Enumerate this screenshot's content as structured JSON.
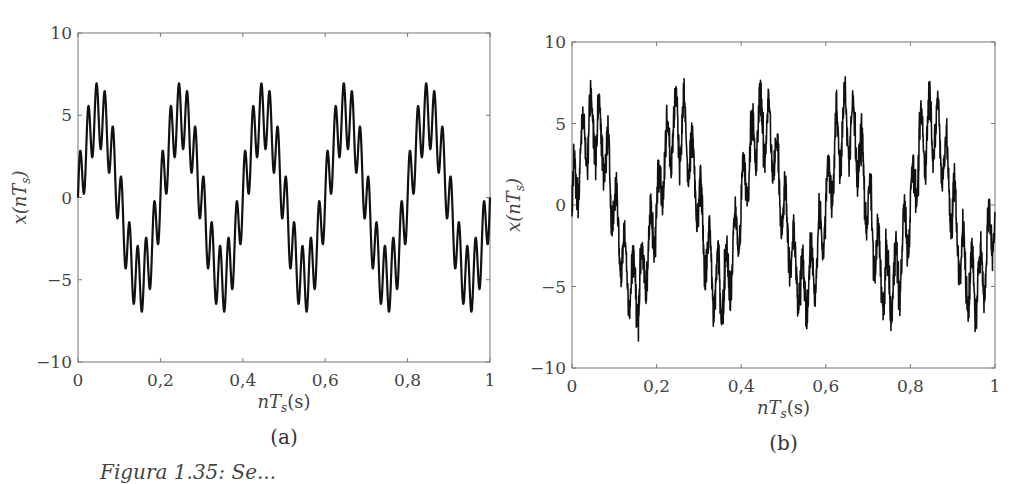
{
  "figure": {
    "caption_partial": "Figura 1.35: Se... ",
    "panels": [
      {
        "id": "a",
        "label": "(a)"
      },
      {
        "id": "b",
        "label": "(b)"
      }
    ]
  },
  "chart_data": [
    {
      "type": "line",
      "title": "(a)",
      "xlabel": "nT_s(s)",
      "ylabel": "x(nT_s)",
      "xlim": [
        0,
        1
      ],
      "ylim": [
        -10,
        10
      ],
      "xticks": [
        "0",
        "0,2",
        "0,4",
        "0,6",
        "0,8",
        "1"
      ],
      "yticks": [
        "-10",
        "-5",
        "0",
        "5",
        "10"
      ],
      "grid": false,
      "description": "Clean signal: 5 Hz sinusoid (amplitude ~5) plus 50 Hz sinusoid (amplitude ~2); peaks ~+7, troughs ~-7",
      "series": [
        {
          "name": "x(nT_s)",
          "model": "5*sin(2*pi*5*t) + 2*sin(2*pi*50*t)",
          "max": 7,
          "min": -7
        }
      ]
    },
    {
      "type": "line",
      "title": "(b)",
      "xlabel": "nT_s(s)",
      "ylabel": "x(nT_s)",
      "xlim": [
        0,
        1
      ],
      "ylim": [
        -10,
        10
      ],
      "xticks": [
        "0",
        "0,2",
        "0,4",
        "0,6",
        "0,8",
        "1"
      ],
      "yticks": [
        "-10",
        "-5",
        "0",
        "5",
        "10"
      ],
      "grid": false,
      "description": "Same signal with additive random noise; peaks up to ~9, troughs down to ~-10",
      "series": [
        {
          "name": "x(nT_s) noisy",
          "model": "5*sin(2*pi*5*t) + 2*sin(2*pi*50*t) + noise",
          "max": 9.2,
          "min": -9.9
        }
      ]
    }
  ],
  "axes": {
    "xlabel_main": "nT",
    "xlabel_sub": "s",
    "xlabel_unit": "(s)",
    "ylabel_main": "x(nT",
    "ylabel_sub": "s",
    "ylabel_close": ")"
  }
}
